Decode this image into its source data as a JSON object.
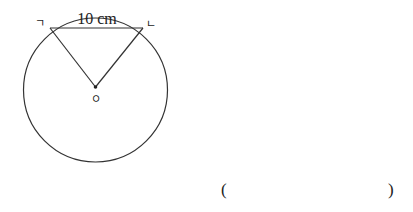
{
  "figure": {
    "chord_label": "10 cm",
    "point_left_label": "ㄱ",
    "point_right_label": "ㄴ",
    "center_label": "ㅇ",
    "stroke_color": "#333333"
  },
  "answer": {
    "open_paren": "(",
    "close_paren": ")",
    "value": ""
  }
}
